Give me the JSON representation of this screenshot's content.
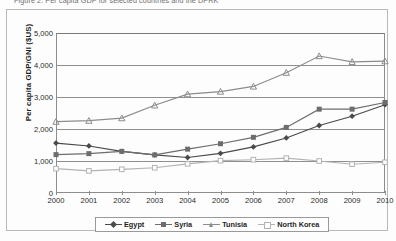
{
  "caption": {
    "text": "Figure 2.  Per capita GDP for selected countries and the DPRK"
  },
  "chart_data": {
    "type": "line",
    "title": "",
    "xlabel": "",
    "ylabel": "Per capita GDP/GNI ($US)",
    "categories": [
      "2000",
      "2001",
      "2002",
      "2003",
      "2004",
      "2005",
      "2006",
      "2007",
      "2008",
      "2009",
      "2010"
    ],
    "x": [
      2000,
      2001,
      2002,
      2003,
      2004,
      2005,
      2006,
      2007,
      2008,
      2009,
      2010
    ],
    "xlim": [
      2000,
      2010
    ],
    "ylim": [
      0,
      5000
    ],
    "yticks": [
      "0",
      "1,000",
      "2,000",
      "3,000",
      "4,000",
      "5,000"
    ],
    "ytick_values": [
      0,
      1000,
      2000,
      3000,
      4000,
      5000
    ],
    "grid": true,
    "legend_position": "bottom",
    "series": [
      {
        "name": "Egypt",
        "marker": "diamond",
        "color": "#4a4a4a",
        "values": [
          1560,
          1470,
          1300,
          1190,
          1110,
          1240,
          1440,
          1720,
          2110,
          2400,
          2760
        ]
      },
      {
        "name": "Syria",
        "marker": "square",
        "color": "#6d6d6d",
        "values": [
          1200,
          1230,
          1300,
          1190,
          1370,
          1540,
          1740,
          2050,
          2620,
          2620,
          2830
        ]
      },
      {
        "name": "Tunisia",
        "marker": "triangle",
        "color": "#8c8c8c",
        "values": [
          2230,
          2260,
          2340,
          2740,
          3090,
          3170,
          3330,
          3760,
          4280,
          4100,
          4120
        ]
      },
      {
        "name": "North Korea",
        "marker": "open-square",
        "color": "#b3b3b3",
        "values": [
          760,
          690,
          740,
          790,
          910,
          1010,
          1040,
          1090,
          1000,
          900,
          960
        ]
      }
    ]
  },
  "colors": {
    "axis": "#8d8d8d",
    "grid": "#8f8f8f",
    "frame": "#b9b9b9",
    "background": "#fdfdfd",
    "text": "#1f1f1f"
  }
}
